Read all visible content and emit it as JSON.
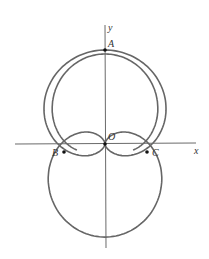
{
  "figure": {
    "type": "polar-curves",
    "axes": {
      "x_label": "x",
      "y_label": "y"
    },
    "points": [
      {
        "label": "A",
        "role": "top intersection on y-axis"
      },
      {
        "label": "O",
        "role": "origin"
      },
      {
        "label": "B",
        "role": "left intersection"
      },
      {
        "label": "C",
        "role": "right intersection"
      }
    ],
    "colors": {
      "curve": "#666666",
      "axis": "#444444",
      "point": "#111111"
    }
  },
  "labels": {
    "x": "x",
    "y": "y",
    "A": "A",
    "O": "O",
    "B": "B",
    "C": "C"
  }
}
